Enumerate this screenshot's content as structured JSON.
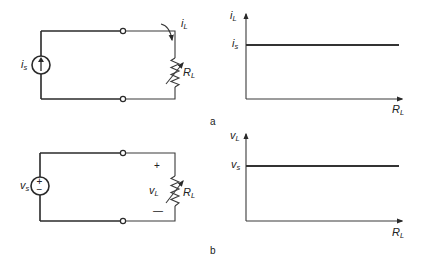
{
  "figure": {
    "panel_a": {
      "caption": "a",
      "circuit": {
        "source_type": "current-source",
        "source_label": "i",
        "source_label_sub": "s",
        "load_label": "R",
        "load_label_sub": "L",
        "current_label": "i",
        "current_label_sub": "L"
      },
      "graph": {
        "y_label": "i",
        "y_label_sub": "L",
        "level_label": "i",
        "level_label_sub": "s",
        "x_label": "R",
        "x_label_sub": "L"
      }
    },
    "panel_b": {
      "caption": "b",
      "circuit": {
        "source_type": "voltage-source",
        "source_label": "v",
        "source_label_sub": "s",
        "source_plus": "+",
        "source_minus": "−",
        "load_label": "R",
        "load_label_sub": "L",
        "voltage_label": "v",
        "voltage_label_sub": "L",
        "plus_sign": "+",
        "minus_sign": "—"
      },
      "graph": {
        "y_label": "v",
        "y_label_sub": "L",
        "level_label": "v",
        "level_label_sub": "s",
        "x_label": "R",
        "x_label_sub": "L"
      }
    }
  }
}
